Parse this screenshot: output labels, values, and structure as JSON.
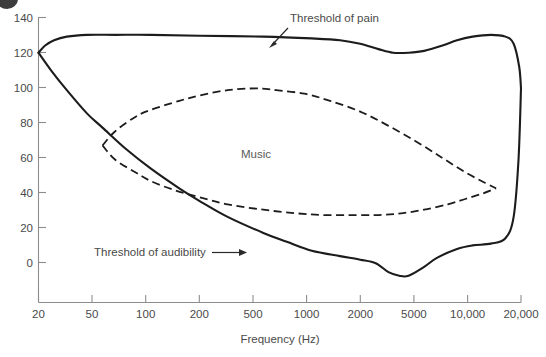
{
  "figure": {
    "marker_name": "figure-bullet",
    "background": "#ffffff",
    "curve_color": "#1c1c1c",
    "axis_color": "#8d8d8d",
    "text_color": "#4a4a4a"
  },
  "chart_data": {
    "type": "line",
    "title": "",
    "xlabel": "Frequency (Hz)",
    "ylabel": "",
    "xscale": "log",
    "xlim": [
      20,
      20000
    ],
    "ylim": [
      -20,
      140
    ],
    "grid": false,
    "legend_position": "none",
    "xticks": [
      20,
      50,
      100,
      200,
      500,
      1000,
      2000,
      5000,
      10000,
      20000
    ],
    "xticklabels": [
      "20",
      "50",
      "100",
      "200",
      "500",
      "1000",
      "2000",
      "5000",
      "10,000",
      "20,000"
    ],
    "yticks": [
      0,
      20,
      40,
      60,
      80,
      100,
      120,
      140
    ],
    "yticklabels": [
      "0",
      "20",
      "40",
      "60",
      "80",
      "100",
      "120",
      "140"
    ],
    "annotations": [
      {
        "name": "threshold-of-pain",
        "text": "Threshold of pain",
        "x": 1500,
        "y": 143
      },
      {
        "name": "threshold-of-audibility",
        "text": "Threshold of audibility",
        "x": 110,
        "y": 13
      },
      {
        "name": "music-region",
        "text": "Music",
        "x": 800,
        "y": 62
      }
    ],
    "series": [
      {
        "name": "Threshold of pain",
        "style": "solid",
        "points": [
          [
            20,
            120
          ],
          [
            22,
            124
          ],
          [
            25,
            127
          ],
          [
            30,
            129
          ],
          [
            40,
            130
          ],
          [
            60,
            130
          ],
          [
            100,
            130
          ],
          [
            200,
            129.5
          ],
          [
            500,
            129
          ],
          [
            1000,
            128
          ],
          [
            1500,
            127
          ],
          [
            2000,
            125
          ],
          [
            2600,
            122
          ],
          [
            3200,
            120
          ],
          [
            4000,
            120
          ],
          [
            5000,
            121
          ],
          [
            6500,
            124
          ],
          [
            8000,
            127
          ],
          [
            10000,
            129
          ],
          [
            13000,
            130
          ],
          [
            16000,
            129
          ],
          [
            18000,
            125
          ],
          [
            19500,
            112
          ],
          [
            20000,
            100
          ]
        ]
      },
      {
        "name": "Threshold of audibility",
        "style": "solid",
        "points": [
          [
            20,
            120
          ],
          [
            24,
            110
          ],
          [
            30,
            99
          ],
          [
            40,
            86
          ],
          [
            50,
            78
          ],
          [
            70,
            66
          ],
          [
            100,
            55
          ],
          [
            150,
            44
          ],
          [
            200,
            37
          ],
          [
            300,
            28
          ],
          [
            500,
            19
          ],
          [
            700,
            14
          ],
          [
            1000,
            9
          ],
          [
            1500,
            6
          ],
          [
            2000,
            4
          ],
          [
            2500,
            2
          ],
          [
            3000,
            -3
          ],
          [
            3500,
            -5
          ],
          [
            4000,
            -5
          ],
          [
            5000,
            0
          ],
          [
            6000,
            5
          ],
          [
            8000,
            10
          ],
          [
            10000,
            12
          ],
          [
            13000,
            13
          ],
          [
            16000,
            16
          ],
          [
            18000,
            28
          ],
          [
            19300,
            60
          ],
          [
            20000,
            100
          ]
        ]
      },
      {
        "name": "Music upper limit",
        "style": "dashed",
        "points": [
          [
            50,
            68
          ],
          [
            60,
            76
          ],
          [
            80,
            84
          ],
          [
            100,
            88
          ],
          [
            150,
            93
          ],
          [
            200,
            96
          ],
          [
            300,
            99
          ],
          [
            450,
            100
          ],
          [
            600,
            99
          ],
          [
            900,
            97
          ],
          [
            1300,
            93
          ],
          [
            2000,
            87
          ],
          [
            3000,
            79
          ],
          [
            4500,
            70
          ],
          [
            6500,
            61
          ],
          [
            9000,
            53
          ],
          [
            12000,
            47
          ],
          [
            14000,
            44
          ]
        ]
      },
      {
        "name": "Music lower limit",
        "style": "dashed",
        "points": [
          [
            50,
            68
          ],
          [
            60,
            60
          ],
          [
            80,
            53
          ],
          [
            100,
            48
          ],
          [
            140,
            43
          ],
          [
            200,
            39
          ],
          [
            300,
            35
          ],
          [
            500,
            32
          ],
          [
            800,
            30
          ],
          [
            1200,
            29
          ],
          [
            1800,
            29
          ],
          [
            2600,
            29
          ],
          [
            3600,
            30
          ],
          [
            5000,
            32
          ],
          [
            7000,
            35
          ],
          [
            9000,
            38
          ],
          [
            11500,
            41
          ],
          [
            14000,
            44
          ]
        ]
      }
    ]
  },
  "axes": {
    "x_axis_name": "x-axis",
    "y_axis_name": "y-axis"
  }
}
